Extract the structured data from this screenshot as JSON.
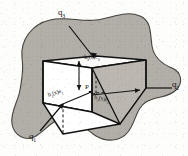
{
  "figure": {
    "colors": {
      "region_fill": "#b0aca6",
      "region_stroke": "#3a3a38",
      "cube_stroke": "#111111",
      "cube_face_light": "#ffffff",
      "cube_face_shaded": "#b9b5ae",
      "page_background": "#fdfdfc",
      "text": "#121212"
    },
    "axis_labels": [
      {
        "id": "q1",
        "text": "q",
        "sub": "1"
      },
      {
        "id": "q2",
        "text": "q",
        "sub": "2"
      },
      {
        "id": "q3",
        "text": "q",
        "sub": "3"
      }
    ],
    "edge_labels": [
      {
        "id": "e1",
        "text": "h",
        "sub": "1",
        "arg": "(x)",
        "unit": "e",
        "unit_sub": "1",
        "full": "h₁(x)e₁"
      },
      {
        "id": "e2",
        "text": "h",
        "sub": "2",
        "arg": "(x)",
        "unit": "e",
        "unit_sub": "2",
        "full": "h₂(x)e₂"
      },
      {
        "id": "e3",
        "text": "h",
        "sub": "3",
        "arg": "(x)",
        "unit": "e",
        "unit_sub": "3",
        "full": "h₃(x)e₃"
      }
    ],
    "point_label": {
      "id": "P",
      "text": "P"
    },
    "label_text": {
      "q1": "q",
      "q1_sub": "1",
      "q2": "q",
      "q2_sub": "2",
      "q3": "q",
      "q3_sub": "3",
      "h1": "h",
      "h1_sub": "1",
      "h1_rest": "(x)e",
      "h1_rest_sub": "1",
      "h2": "h",
      "h2_sub": "2",
      "h2_rest": "(x)e",
      "h2_rest_sub": "2",
      "h3": "h",
      "h3_sub": "3",
      "h3_rest": "(x)e",
      "h3_rest_sub": "3",
      "point": "P"
    }
  }
}
